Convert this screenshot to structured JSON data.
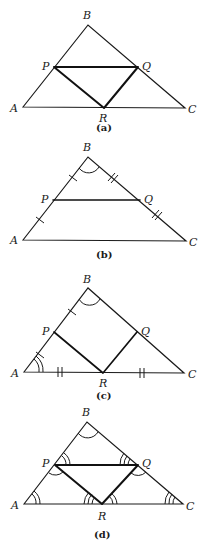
{
  "figures": [
    {
      "id": "a",
      "caption": "(a)",
      "labels": {
        "A": "A",
        "B": "B",
        "C": "C",
        "P": "P",
        "Q": "Q",
        "R": "R"
      },
      "description": "Triangle ABC with midpoint triangle PQR drawn in bold (segments PQ, PR, QR)"
    },
    {
      "id": "b",
      "caption": "(b)",
      "labels": {
        "A": "A",
        "B": "B",
        "C": "C",
        "P": "P",
        "Q": "Q"
      },
      "description": "Triangle ABC with segment PQ; single tick marks on AP and PB, double tick marks on BQ and QC; angle arc at B"
    },
    {
      "id": "c",
      "caption": "(c)",
      "labels": {
        "A": "A",
        "B": "B",
        "C": "C",
        "P": "P",
        "Q": "Q",
        "R": "R"
      },
      "description": "Triangle ABC with segments PR and QR in bold; single ticks on AP and PB, double ticks on AR and RC; single arc at B, double arc at A"
    },
    {
      "id": "d",
      "caption": "(d)",
      "labels": {
        "A": "A",
        "B": "B",
        "C": "C",
        "P": "P",
        "Q": "Q",
        "R": "R"
      },
      "description": "Triangle ABC with bold triangle PQR; angle arcs: B single, A double, C triple; at P double (BPQ) and single (QPR); at Q triple (BQP) and single (PQR); at R triple (ARP) and double (QRC)"
    }
  ],
  "colors": {
    "stroke": "#1a1a1a",
    "background": "#ffffff"
  }
}
